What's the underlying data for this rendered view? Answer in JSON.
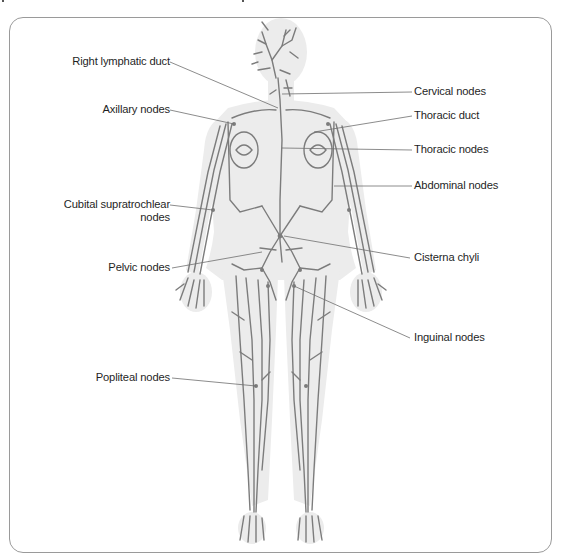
{
  "diagram": {
    "colors": {
      "frame": "#9a9a9a",
      "silhouette": "#ececec",
      "vessels": "#7c7c7c",
      "leader_lines": "#6e6e6e",
      "label_text": "#1f1f1f"
    },
    "labels_left": [
      {
        "id": "right-lymphatic-duct",
        "text": "Right lymphatic duct"
      },
      {
        "id": "axillary-nodes",
        "text": "Axillary nodes"
      },
      {
        "id": "cubital-supratrochlear-nodes",
        "text": "Cubital supratrochlear",
        "text_line2": "nodes"
      },
      {
        "id": "pelvic-nodes",
        "text": "Pelvic nodes"
      },
      {
        "id": "popliteal-nodes",
        "text": "Popliteal nodes"
      }
    ],
    "labels_right": [
      {
        "id": "cervical-nodes",
        "text": "Cervical nodes"
      },
      {
        "id": "thoracic-duct",
        "text": "Thoracic duct"
      },
      {
        "id": "thoracic-nodes",
        "text": "Thoracic nodes"
      },
      {
        "id": "abdominal-nodes",
        "text": "Abdominal nodes"
      },
      {
        "id": "cisterna-chyli",
        "text": "Cisterna chyli"
      },
      {
        "id": "inguinal-nodes",
        "text": "Inguinal nodes"
      }
    ]
  }
}
